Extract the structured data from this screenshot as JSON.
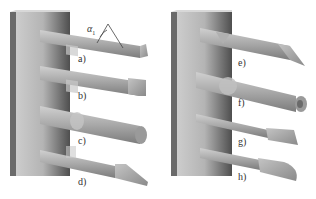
{
  "figure": {
    "panels": [
      {
        "side": "left",
        "tools": [
          {
            "id": "a",
            "label": "a)",
            "tip": "flat-chisel",
            "y": 46
          },
          {
            "id": "b",
            "label": "b)",
            "tip": "square-end",
            "y": 84
          },
          {
            "id": "c",
            "label": "c)",
            "tip": "round-end",
            "y": 128
          },
          {
            "id": "d",
            "label": "d)",
            "tip": "angled-point",
            "y": 165
          }
        ]
      },
      {
        "side": "right",
        "tools": [
          {
            "id": "e",
            "label": "e)",
            "tip": "triangular-point",
            "y": 46
          },
          {
            "id": "f",
            "label": "f)",
            "tip": "hollow-round",
            "y": 86
          },
          {
            "id": "g",
            "label": "g)",
            "tip": "flared-flat",
            "y": 128
          },
          {
            "id": "h",
            "label": "h)",
            "tip": "bullet-point",
            "y": 162
          }
        ]
      }
    ],
    "annotation": {
      "symbol": "α",
      "subscript": "1",
      "meaning": "tip angle"
    },
    "colors": {
      "wall_light": "#c8c8c8",
      "wall_dark": "#5a5a5a",
      "tool_light": "#bdbdbd",
      "tool_dark": "#7a7a7a",
      "label": "#333333",
      "background": "#ffffff"
    }
  }
}
